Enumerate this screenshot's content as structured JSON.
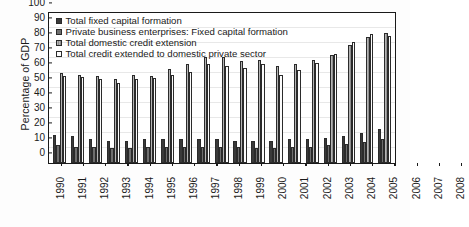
{
  "chart_data": {
    "type": "bar",
    "title": "",
    "xlabel": "",
    "ylabel": "Percentage of GDP",
    "ylim": [
      0,
      100
    ],
    "ytick_step": 10,
    "yticks": [
      0,
      10,
      20,
      30,
      40,
      50,
      60,
      70,
      80,
      90,
      100
    ],
    "grid": true,
    "legend_position": "top-left",
    "categories": [
      "1990",
      "1991",
      "1992",
      "1993",
      "1994",
      "1995",
      "1996",
      "1997",
      "1998",
      "1999",
      "2000",
      "2001",
      "2002",
      "2003",
      "2004",
      "2005",
      "2006",
      "2007",
      "2008"
    ],
    "series": [
      {
        "name": "Total fixed capital formation",
        "color": "#3a3a3a",
        "values": [
          19,
          18,
          16,
          15,
          15,
          16,
          16,
          16,
          16,
          16,
          15,
          15,
          15,
          16,
          16,
          17,
          18,
          20,
          23
        ]
      },
      {
        "name": "Private business enterprises: Fixed capital formation",
        "color": "#6e6e6e",
        "values": [
          12,
          11,
          11,
          10,
          10,
          11,
          11,
          11,
          11,
          11,
          11,
          10,
          10,
          11,
          11,
          12,
          13,
          14,
          16
        ]
      },
      {
        "name": "Total domestic credit extension",
        "color": "#a8a8a8",
        "values": [
          60,
          59,
          58,
          56,
          59,
          58,
          63,
          66,
          71,
          70.5,
          68,
          69,
          65,
          66,
          69,
          72,
          79,
          84,
          87
        ]
      },
      {
        "name": "Total credit extended to domestic private sector",
        "color": "#fcfcfc",
        "values": [
          58,
          57.5,
          56,
          53.5,
          56,
          57,
          59,
          61,
          66,
          65,
          63.5,
          66,
          59,
          62,
          67,
          73,
          81,
          86,
          85
        ]
      }
    ]
  },
  "legend": {
    "items": [
      {
        "label": "Total fixed capital formation",
        "swatch_class": "s0"
      },
      {
        "label": "Private business enterprises: Fixed capital formation",
        "swatch_class": "s1"
      },
      {
        "label": "Total domestic credit extension",
        "swatch_class": "s2"
      },
      {
        "label": "Total credit extended to domestic private sector",
        "swatch_class": "s3"
      }
    ]
  }
}
